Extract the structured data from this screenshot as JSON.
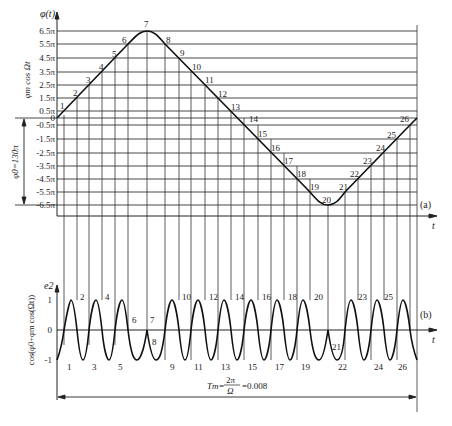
{
  "panel_a": {
    "y_axis_label": "φ(t)",
    "x_axis_label": "t",
    "panel_tag": "(a)",
    "side_label_upper": "φm cos Ωt",
    "side_label_lower": "φ0=130π",
    "y_ticks": [
      "6.5π",
      "5.5π",
      "4.5π",
      "3.5π",
      "2.5π",
      "1.5π",
      "0.5π",
      "0",
      "-0.5π",
      "-1.5π",
      "-2.5π",
      "-3.5π",
      "-4.5π",
      "-5.5π",
      "-6.5π"
    ],
    "point_labels": [
      "1",
      "2",
      "3",
      "4",
      "5",
      "6",
      "7",
      "8",
      "9",
      "10",
      "11",
      "12",
      "13",
      "14",
      "15",
      "16",
      "17",
      "18",
      "19",
      "20",
      "21",
      "22",
      "23",
      "24",
      "25",
      "26"
    ]
  },
  "panel_b": {
    "y_axis_label": "e2",
    "x_axis_label": "t",
    "panel_tag": "(b)",
    "side_label": "cos(φ0+φm cos(Ωt))",
    "y_ticks": [
      "1",
      "0",
      "-1"
    ],
    "point_labels": [
      "1",
      "2",
      "3",
      "4",
      "5",
      "6",
      "7",
      "8",
      "9",
      "10",
      "11",
      "12",
      "13",
      "14",
      "15",
      "16",
      "17",
      "18",
      "19",
      "20",
      "21",
      "22",
      "23",
      "24",
      "25",
      "26"
    ]
  },
  "period": {
    "label_lhs": "Tm=",
    "numerator": "2π",
    "denominator": "Ω",
    "value": "=0.008"
  },
  "colors": {
    "line": "#222222",
    "background": "#ffffff"
  }
}
